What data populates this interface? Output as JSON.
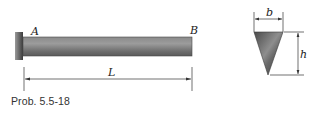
{
  "figure": {
    "caption": "Prob. 5.5-18",
    "beam": {
      "end_left_label": "A",
      "end_right_label": "B",
      "length_label": "L",
      "support": "fixed-wall"
    },
    "cross_section": {
      "shape": "inverted-triangle",
      "width_label": "b",
      "height_label": "h"
    }
  }
}
